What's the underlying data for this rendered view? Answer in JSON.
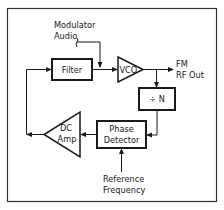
{
  "diagram": {
    "blocks": {
      "filter": {
        "label": "Filter"
      },
      "vco": {
        "label": "VCO"
      },
      "divider": {
        "label": "÷ N"
      },
      "phase_detector": {
        "line1": "Phase",
        "line2": "Detector"
      },
      "dc_amp": {
        "line1": "DC",
        "line2": "Amp"
      }
    },
    "inputs": {
      "modulator": {
        "line1": "Modulator",
        "line2": "Audio"
      },
      "reference": {
        "line1": "Reference",
        "line2": "Frequency"
      }
    },
    "outputs": {
      "rf_out": {
        "line1": "FM",
        "line2": "RF Out"
      }
    },
    "colors": {
      "line": "#1a1a1a",
      "frame": "#333333",
      "background": "#ffffff"
    }
  }
}
